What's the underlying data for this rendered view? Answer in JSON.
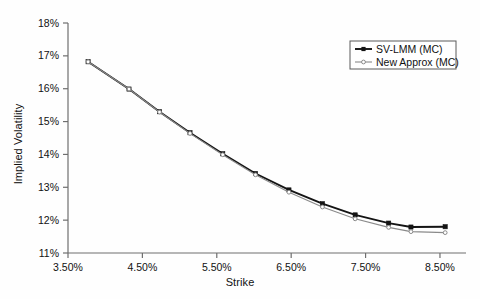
{
  "chart_data": {
    "type": "line",
    "title": "",
    "xlabel": "Strike",
    "ylabel": "Implied Volatility",
    "xlim": [
      3.5,
      8.85
    ],
    "ylim": [
      11.0,
      18.0
    ],
    "xtick_labels": [
      "3.50%",
      "4.50%",
      "5.50%",
      "6.50%",
      "7.50%",
      "8.50%"
    ],
    "xtick_values": [
      3.5,
      4.5,
      5.5,
      6.5,
      7.5,
      8.5
    ],
    "ytick_labels": [
      "11%",
      "12%",
      "13%",
      "14%",
      "15%",
      "16%",
      "17%",
      "18%"
    ],
    "ytick_values": [
      11,
      12,
      13,
      14,
      15,
      16,
      17,
      18
    ],
    "grid": false,
    "legend_position": "top-right",
    "x": [
      3.77,
      4.32,
      4.73,
      5.14,
      5.58,
      6.02,
      6.47,
      6.92,
      7.36,
      7.81,
      8.11,
      8.57
    ],
    "series": [
      {
        "name": "SV-LMM (MC)",
        "marker": "filled-square",
        "color": "#141414",
        "values": [
          16.82,
          15.99,
          15.3,
          14.66,
          14.02,
          13.42,
          12.92,
          12.5,
          12.16,
          11.91,
          11.79,
          11.8
        ]
      },
      {
        "name": "New Approx (MC)",
        "marker": "open-circle",
        "color": "#8a8a8a",
        "values": [
          16.82,
          15.99,
          15.29,
          14.64,
          13.99,
          13.38,
          12.85,
          12.4,
          12.04,
          11.78,
          11.65,
          11.62
        ]
      }
    ]
  },
  "legend": {
    "entries": [
      {
        "label": "SV-LMM (MC)"
      },
      {
        "label": "New Approx (MC)"
      }
    ]
  },
  "colors": {
    "series_primary": "#141414",
    "series_secondary": "#8a8a8a",
    "axis": "#6e6e6e",
    "text": "#111111",
    "background": "#fefefe"
  }
}
